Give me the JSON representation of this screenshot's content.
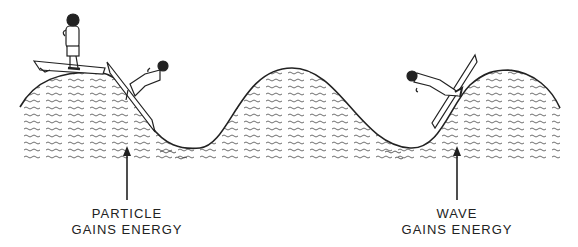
{
  "diagram": {
    "labels": {
      "left": {
        "line1": "PARTICLE",
        "line2": "GAINS ENERGY"
      },
      "right": {
        "line1": "WAVE",
        "line2": "GAINS ENERGY"
      }
    },
    "elements": [
      "wave-curve",
      "surfer-standing-on-board",
      "surfer-sliding-down-wave",
      "surfer-pushed-by-wave",
      "arrow-left",
      "arrow-right"
    ],
    "colors": {
      "ink": "#222222",
      "background": "#ffffff"
    }
  }
}
